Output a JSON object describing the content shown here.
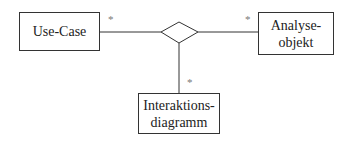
{
  "diagram": {
    "type": "UML association (n-ary)",
    "nodes": [
      {
        "id": "use-case",
        "label": "Use-Case"
      },
      {
        "id": "analyseobjekt",
        "label": "Analyse-\nobjekt",
        "line1": "Analyse-",
        "line2": "objekt"
      },
      {
        "id": "interaktionsdiagramm",
        "label": "Interaktions-\ndiagramm",
        "line1": "Interaktions-",
        "line2": "diagramm"
      }
    ],
    "association": {
      "shape": "diamond"
    },
    "multiplicities": {
      "use_case": "*",
      "analyseobjekt": "*",
      "interaktionsdiagramm": "*"
    },
    "colors": {
      "line": "#333333",
      "multiplicity": "#777777",
      "background": "#ffffff"
    }
  }
}
